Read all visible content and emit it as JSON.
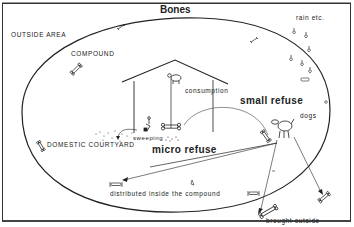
{
  "diagram": {
    "title": "Bones",
    "areas": {
      "outside": "OUTSIDE AREA",
      "compound": "COMPOUND",
      "courtyard": "DOMESTIC COURTYARD"
    },
    "labels": {
      "rain": "rain etc.",
      "consumption": "consumption",
      "small_refuse": "small refuse",
      "sweeping": "sweeping",
      "micro_refuse": "micro refuse",
      "dogs": "dogs",
      "distributed": "distributed inside the compound",
      "brought_outside": "brought outside"
    },
    "colors": {
      "line": "#222222",
      "background": "#ffffff"
    }
  }
}
